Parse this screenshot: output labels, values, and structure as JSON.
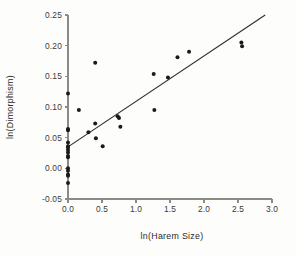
{
  "chart_data": {
    "type": "scatter",
    "title": "",
    "subtitle": "",
    "xlabel": "ln(Harem  Size)",
    "ylabel": "ln(Dimorphism)",
    "xlim": [
      0.0,
      3.0
    ],
    "ylim": [
      -0.05,
      0.25
    ],
    "xticks": [
      0.0,
      0.5,
      1.0,
      1.5,
      2.0,
      2.5,
      3.0
    ],
    "xticklabels": [
      "0.0",
      "0.5",
      "1.0",
      "1.5",
      "2.0",
      "2.5",
      "3.0"
    ],
    "yticks": [
      -0.05,
      0.0,
      0.05,
      0.1,
      0.15,
      0.2,
      0.25
    ],
    "yticklabels": [
      "-0.05",
      "0.00",
      "0.05",
      "0.10",
      "0.15",
      "0.20",
      "0.25"
    ],
    "grid": false,
    "legend": null,
    "marker": "filled-circle",
    "marker_color": "#1a1a1a",
    "points": [
      [
        0.0,
        0.122
      ],
      [
        0.0,
        0.064
      ],
      [
        0.0,
        0.062
      ],
      [
        0.0,
        0.042
      ],
      [
        0.0,
        0.036
      ],
      [
        0.0,
        0.034
      ],
      [
        0.0,
        0.03
      ],
      [
        0.0,
        0.026
      ],
      [
        0.0,
        0.02
      ],
      [
        0.0,
        0.018
      ],
      [
        0.0,
        0.0
      ],
      [
        0.0,
        -0.004
      ],
      [
        0.0,
        -0.01
      ],
      [
        0.0,
        -0.012
      ],
      [
        0.0,
        -0.024
      ],
      [
        0.16,
        0.095
      ],
      [
        0.3,
        0.059
      ],
      [
        0.4,
        0.172
      ],
      [
        0.4,
        0.073
      ],
      [
        0.41,
        0.049
      ],
      [
        0.51,
        0.036
      ],
      [
        0.73,
        0.085
      ],
      [
        0.75,
        0.082
      ],
      [
        0.77,
        0.068
      ],
      [
        1.26,
        0.154
      ],
      [
        1.27,
        0.095
      ],
      [
        1.47,
        0.148
      ],
      [
        1.61,
        0.181
      ],
      [
        1.78,
        0.19
      ],
      [
        2.55,
        0.205
      ],
      [
        2.56,
        0.199
      ]
    ],
    "fit_line": {
      "label": "regression line",
      "x": [
        0.0,
        2.9
      ],
      "y": [
        0.035,
        0.25
      ]
    }
  }
}
